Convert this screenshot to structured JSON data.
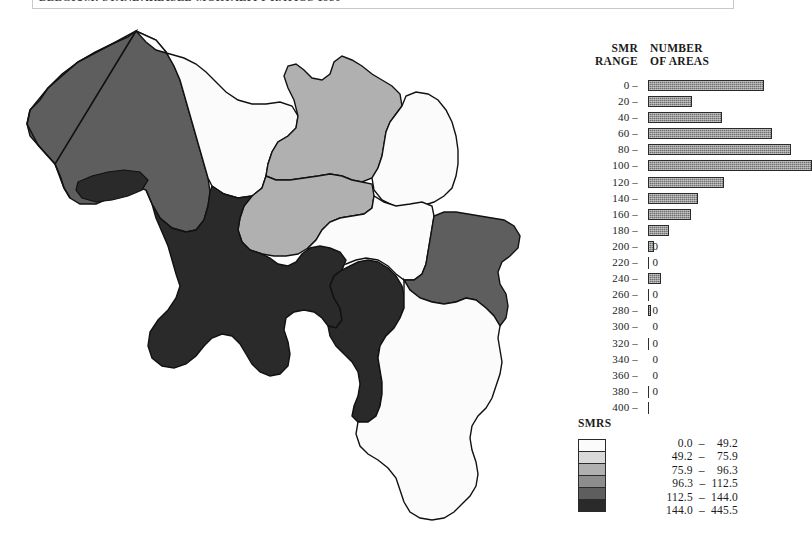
{
  "header": {
    "title": "BELGIUM: STANDARDISED MORTALITY RATIOS 1980",
    "close_label": "✕"
  },
  "histogram": {
    "col_header_left": "SMR\nRANGE",
    "col_header_left_line1": "SMR",
    "col_header_left_line2": "RANGE",
    "col_header_right_line1": "NUMBER",
    "col_header_right_line2": "OF AREAS",
    "bar_color": "#6f6f6f",
    "bar_outline": "#2a2a2a",
    "rows": [
      {
        "range": "0 –",
        "count": "0",
        "bar_px": 116
      },
      {
        "range": "20 –",
        "count": "1",
        "bar_px": 44
      },
      {
        "range": "40 –",
        "count": "1",
        "bar_px": 74
      },
      {
        "range": "60 –",
        "count": "1",
        "bar_px": 124
      },
      {
        "range": "80 –",
        "count": "2",
        "bar_px": 143
      },
      {
        "range": "100 –",
        "count": "1",
        "bar_px": 164
      },
      {
        "range": "120 –",
        "count": "1",
        "bar_px": 76
      },
      {
        "range": "140 –",
        "count": "1",
        "bar_px": 50
      },
      {
        "range": "160 –",
        "count": "0",
        "bar_px": 43
      },
      {
        "range": "180 –",
        "count": "1",
        "bar_px": 21
      },
      {
        "range": "200 –",
        "count": "0",
        "bar_px": 6
      },
      {
        "range": "220 –",
        "count": "0",
        "bar_px": 1
      },
      {
        "range": "240 –",
        "count": "0",
        "bar_px": 13
      },
      {
        "range": "260 –",
        "count": "0",
        "bar_px": 1
      },
      {
        "range": "280 –",
        "count": "0",
        "bar_px": 3
      },
      {
        "range": "300 –",
        "count": "0",
        "bar_px": 0
      },
      {
        "range": "320 –",
        "count": "0",
        "bar_px": 1
      },
      {
        "range": "340 –",
        "count": "0",
        "bar_px": 0
      },
      {
        "range": "360 –",
        "count": "0",
        "bar_px": 0
      },
      {
        "range": "380 –",
        "count": "0",
        "bar_px": 1
      },
      {
        "range": "400 –",
        "count": "",
        "bar_px": 1
      }
    ]
  },
  "smrs_legend": {
    "title": "SMRS",
    "classes": [
      {
        "label": "  0.0  –    49.2",
        "color": "#fbfbfb"
      },
      {
        "label": " 49.2  –    75.9",
        "color": "#d9d9d9"
      },
      {
        "label": " 75.9  –    96.3",
        "color": "#b0b0b0"
      },
      {
        "label": " 96.3  –  112.5",
        "color": "#8d8d8d"
      },
      {
        "label": "112.5  –  144.0",
        "color": "#5e5e5e"
      },
      {
        "label": "144.0  –  445.5",
        "color": "#2a2a2a"
      }
    ]
  },
  "chart_data": {
    "type": "map",
    "title": "BELGIUM: STANDARDISED MORTALITY RATIOS 1980",
    "variable": "SMR",
    "class_breaks": [
      0.0,
      49.2,
      75.9,
      96.3,
      112.5,
      144.0,
      445.5
    ],
    "class_colors": [
      "#fbfbfb",
      "#d9d9d9",
      "#b0b0b0",
      "#8d8d8d",
      "#5e5e5e",
      "#2a2a2a"
    ],
    "histogram": {
      "type": "bar",
      "orientation": "horizontal",
      "xlabel": "NUMBER OF AREAS",
      "ylabel": "SMR RANGE",
      "categories": [
        "0",
        "20",
        "40",
        "60",
        "80",
        "100",
        "120",
        "140",
        "160",
        "180",
        "200",
        "220",
        "240",
        "260",
        "280",
        "300",
        "320",
        "340",
        "360",
        "380",
        "400"
      ],
      "values": [
        0,
        1,
        1,
        1,
        2,
        1,
        1,
        1,
        0,
        1,
        0,
        0,
        0,
        0,
        0,
        0,
        0,
        0,
        0,
        0,
        null
      ]
    },
    "regions": [
      {
        "name": "West-Vlaanderen",
        "class_index": 4
      },
      {
        "name": "Oost-Vlaanderen",
        "class_index": 0
      },
      {
        "name": "Antwerpen",
        "class_index": 2
      },
      {
        "name": "Limburg",
        "class_index": 0
      },
      {
        "name": "Vlaams-Brabant",
        "class_index": 2
      },
      {
        "name": "Brabant-Wallon",
        "class_index": 0
      },
      {
        "name": "Hainaut",
        "class_index": 5
      },
      {
        "name": "Namur",
        "class_index": 5
      },
      {
        "name": "Liege",
        "class_index": 4
      },
      {
        "name": "Luxembourg",
        "class_index": 0
      }
    ]
  }
}
